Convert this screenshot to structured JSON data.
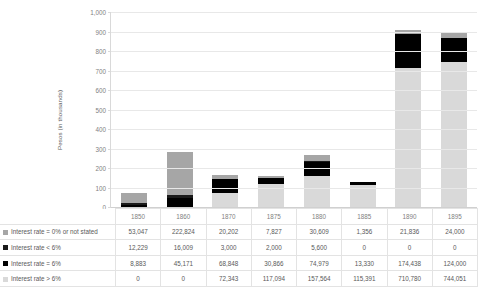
{
  "chart_data": {
    "type": "bar",
    "stacked": true,
    "title": "",
    "xlabel": "",
    "ylabel": "Pesos (in thousands)",
    "ylim": [
      0,
      1000
    ],
    "ytick_step": 100,
    "ytick_labels": [
      "0",
      "100",
      "200",
      "300",
      "400",
      "500",
      "600",
      "700",
      "800",
      "900",
      "1,000"
    ],
    "grid": true,
    "legend_position": "bottom-table",
    "units_note": "Table values are in pesos; chart plots thousands of pesos",
    "categories": [
      "1850",
      "1860",
      "1870",
      "1875",
      "1880",
      "1885",
      "1890",
      "1895"
    ],
    "series": [
      {
        "name": "Interest rate = 0% or not stated",
        "color": "#a6a6a6",
        "stack_order": 4,
        "values": [
          53047,
          222824,
          20202,
          7827,
          30609,
          1356,
          21836,
          24000
        ],
        "display": [
          "53,047",
          "222,824",
          "20,202",
          "7,827",
          "30,609",
          "1,356",
          "21,836",
          "24,000"
        ]
      },
      {
        "name": "Interest rate < 6%",
        "color": "#1a1a1a",
        "stack_order": 3,
        "values": [
          12229,
          16009,
          3000,
          2000,
          5600,
          0,
          0,
          0
        ],
        "display": [
          "12,229",
          "16,009",
          "3,000",
          "2,000",
          "5,600",
          "0",
          "0",
          "0"
        ]
      },
      {
        "name": "Interest rate = 6%",
        "color": "#000000",
        "stack_order": 2,
        "values": [
          8883,
          45171,
          68848,
          30866,
          74979,
          13330,
          174438,
          124000
        ],
        "display": [
          "8,883",
          "45,171",
          "68,848",
          "30,866",
          "74,979",
          "13,330",
          "174,438",
          "124,000"
        ]
      },
      {
        "name": "Interest rate > 6%",
        "color": "#d9d9d9",
        "stack_order": 1,
        "values": [
          0,
          0,
          72343,
          117094,
          157564,
          115391,
          710780,
          744051
        ],
        "display": [
          "0",
          "0",
          "72,343",
          "117,094",
          "157,564",
          "115,391",
          "710,780",
          "744,051"
        ]
      }
    ],
    "totals": [
      74159,
      284004,
      164393,
      157787,
      268752,
      130077,
      907054,
      892051
    ]
  },
  "table": {
    "corner_label": "",
    "column_headers": [
      "1850",
      "1860",
      "1870",
      "1875",
      "1880",
      "1885",
      "1890",
      "1895"
    ],
    "rows": [
      {
        "label": "Interest rate = 0% or not stated",
        "swatch": "#a6a6a6",
        "cells": [
          "53,047",
          "222,824",
          "20,202",
          "7,827",
          "30,609",
          "1,356",
          "21,836",
          "24,000"
        ]
      },
      {
        "label": "Interest rate < 6%",
        "swatch": "#1a1a1a",
        "cells": [
          "12,229",
          "16,009",
          "3,000",
          "2,000",
          "5,600",
          "0",
          "0",
          "0"
        ]
      },
      {
        "label": "Interest rate = 6%",
        "swatch": "#000000",
        "cells": [
          "8,883",
          "45,171",
          "68,848",
          "30,866",
          "74,979",
          "13,330",
          "174,438",
          "124,000"
        ]
      },
      {
        "label": "Interest rate > 6%",
        "swatch": "#d9d9d9",
        "cells": [
          "0",
          "0",
          "72,343",
          "117,094",
          "157,564",
          "115,391",
          "710,780",
          "744,051"
        ]
      }
    ]
  },
  "colors": {
    "grid": "#e8e8e8",
    "axis": "#d9d9d9",
    "text": "#595959",
    "tick_text": "#7f7f7f",
    "background": "#ffffff"
  }
}
